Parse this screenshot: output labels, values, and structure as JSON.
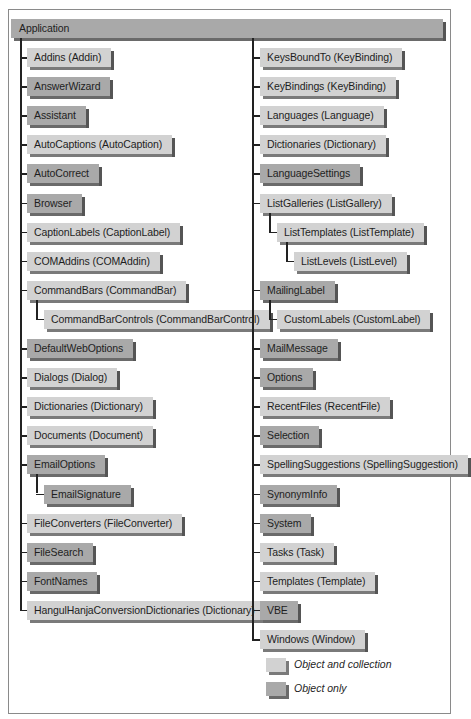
{
  "root": {
    "label": "Application",
    "kind": "obj"
  },
  "left_column": [
    {
      "label": "Addins (Addin)",
      "kind": "coll"
    },
    {
      "label": "AnswerWizard",
      "kind": "obj"
    },
    {
      "label": "Assistant",
      "kind": "obj"
    },
    {
      "label": "AutoCaptions (AutoCaption)",
      "kind": "coll"
    },
    {
      "label": "AutoCorrect",
      "kind": "obj"
    },
    {
      "label": "Browser",
      "kind": "obj"
    },
    {
      "label": "CaptionLabels (CaptionLabel)",
      "kind": "coll"
    },
    {
      "label": "COMAddins (COMAddin)",
      "kind": "coll"
    },
    {
      "label": "CommandBars (CommandBar)",
      "kind": "coll",
      "children": [
        {
          "label": "CommandBarControls (CommandBarControl)",
          "kind": "coll"
        }
      ]
    },
    {
      "label": "DefaultWebOptions",
      "kind": "obj"
    },
    {
      "label": "Dialogs (Dialog)",
      "kind": "coll"
    },
    {
      "label": "Dictionaries (Dictionary)",
      "kind": "coll"
    },
    {
      "label": "Documents (Document)",
      "kind": "coll"
    },
    {
      "label": "EmailOptions",
      "kind": "obj",
      "children": [
        {
          "label": "EmailSignature",
          "kind": "obj"
        }
      ]
    },
    {
      "label": "FileConverters (FileConverter)",
      "kind": "coll"
    },
    {
      "label": "FileSearch",
      "kind": "obj"
    },
    {
      "label": "FontNames",
      "kind": "obj"
    },
    {
      "label": "HangulHanjaConversionDictionaries (Dictionary)",
      "kind": "coll"
    }
  ],
  "right_column": [
    {
      "label": "KeysBoundTo (KeyBinding)",
      "kind": "coll"
    },
    {
      "label": "KeyBindings (KeyBinding)",
      "kind": "coll"
    },
    {
      "label": "Languages (Language)",
      "kind": "coll"
    },
    {
      "label": "Dictionaries (Dictionary)",
      "kind": "coll"
    },
    {
      "label": "LanguageSettings",
      "kind": "obj"
    },
    {
      "label": "ListGalleries (ListGallery)",
      "kind": "coll",
      "children": [
        {
          "label": "ListTemplates (ListTemplate)",
          "kind": "coll",
          "children": [
            {
              "label": "ListLevels (ListLevel)",
              "kind": "coll"
            }
          ]
        }
      ]
    },
    {
      "label": "MailingLabel",
      "kind": "obj",
      "children": [
        {
          "label": "CustomLabels (CustomLabel)",
          "kind": "coll"
        }
      ]
    },
    {
      "label": "MailMessage",
      "kind": "obj"
    },
    {
      "label": "Options",
      "kind": "obj"
    },
    {
      "label": "RecentFiles (RecentFile)",
      "kind": "coll"
    },
    {
      "label": "Selection",
      "kind": "obj"
    },
    {
      "label": "SpellingSuggestions (SpellingSuggestion)",
      "kind": "coll"
    },
    {
      "label": "SynonymInfo",
      "kind": "obj"
    },
    {
      "label": "System",
      "kind": "obj"
    },
    {
      "label": "Tasks (Task)",
      "kind": "coll"
    },
    {
      "label": "Templates (Template)",
      "kind": "coll"
    },
    {
      "label": "VBE",
      "kind": "obj"
    },
    {
      "label": "Windows (Window)",
      "kind": "coll"
    }
  ],
  "legend": [
    {
      "label": "Object and collection",
      "kind": "coll"
    },
    {
      "label": "Object only",
      "kind": "obj"
    }
  ],
  "colors": {
    "collection": "#d2d2d2",
    "object_only": "#a9a9a9",
    "line": "#222222",
    "frame": "#8a8a8a"
  }
}
